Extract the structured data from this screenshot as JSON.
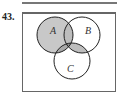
{
  "problem_number": "43.",
  "diagram": {
    "type": "venn-3-set",
    "sets": [
      {
        "name": "A",
        "label": "A"
      },
      {
        "name": "B",
        "label": "B"
      },
      {
        "name": "C",
        "label": "C"
      }
    ],
    "shaded_regions": [
      "A",
      "B∩C"
    ],
    "colors": {
      "shade": "#c8c8c8",
      "shade_overlap": "#a8a8a8",
      "shade_center": "#8c8c8c",
      "stroke": "#222222"
    }
  }
}
